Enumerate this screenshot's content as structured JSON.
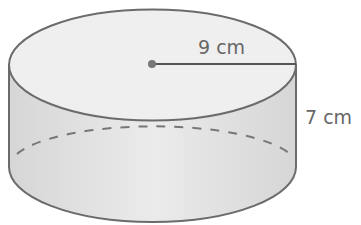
{
  "figure": {
    "type": "cylinder",
    "radius_label": "9 cm",
    "height_label": "7 cm",
    "colors": {
      "stroke": "#6b6b6b",
      "top_fill": "#ececec",
      "side_fill": "#dcdcdc",
      "text": "#666666"
    }
  }
}
